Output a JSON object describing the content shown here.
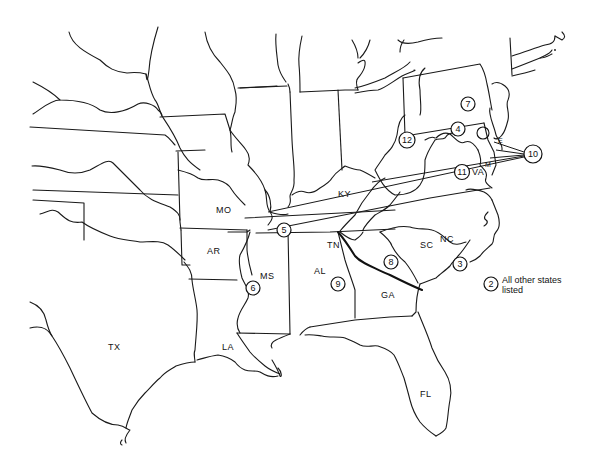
{
  "map": {
    "state_labels": [
      {
        "id": "MO",
        "text": "MO",
        "x": 216,
        "y": 210
      },
      {
        "id": "KY",
        "text": "KY",
        "x": 339,
        "y": 194
      },
      {
        "id": "TN",
        "text": "TN",
        "x": 327,
        "y": 245
      },
      {
        "id": "NC",
        "text": "NC",
        "x": 441,
        "y": 241
      },
      {
        "id": "AR",
        "text": "AR",
        "x": 208,
        "y": 251
      },
      {
        "id": "MS",
        "text": "MS",
        "x": 261,
        "y": 276
      },
      {
        "id": "AL",
        "text": "AL",
        "x": 315,
        "y": 271
      },
      {
        "id": "SC",
        "text": "SC",
        "x": 421,
        "y": 248
      },
      {
        "id": "GA",
        "text": "GA",
        "x": 382,
        "y": 296
      },
      {
        "id": "TX",
        "text": "TX",
        "x": 108,
        "y": 347
      },
      {
        "id": "LA",
        "text": "LA",
        "x": 222,
        "y": 348
      },
      {
        "id": "FL",
        "text": "FL",
        "x": 420,
        "y": 394
      },
      {
        "id": "VA",
        "text": "VA",
        "x": 476,
        "y": 286
      },
      {
        "id": "DE",
        "text": "E",
        "x": 498,
        "y": 143
      },
      {
        "id": "MD",
        "text": "M",
        "x": 488,
        "y": 168
      }
    ],
    "markers": [
      {
        "num": "3",
        "x": 460,
        "y": 264
      },
      {
        "num": "4",
        "x": 458,
        "y": 129
      },
      {
        "num": "5",
        "x": 284,
        "y": 230
      },
      {
        "num": "6",
        "x": 253,
        "y": 288
      },
      {
        "num": "7",
        "x": 468,
        "y": 104
      },
      {
        "num": "8",
        "x": 391,
        "y": 262
      },
      {
        "num": "9",
        "x": 338,
        "y": 284
      },
      {
        "num": "10",
        "x": 535,
        "y": 154
      },
      {
        "num": "11",
        "x": 462,
        "y": 172
      },
      {
        "num": "12",
        "x": 407,
        "y": 140
      }
    ],
    "legend": {
      "marker_num": "2",
      "line1": "All other states",
      "line2": "listed"
    }
  }
}
